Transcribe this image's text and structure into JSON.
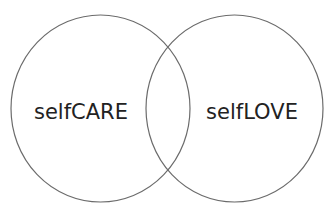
{
  "diagram": {
    "type": "venn",
    "circles": [
      {
        "label": "selfCARE",
        "cx": 100.5,
        "cy": 108.5,
        "rx": 89.5,
        "ry": 93.5
      },
      {
        "label": "selfLOVE",
        "cx": 234.5,
        "cy": 108.5,
        "rx": 88.5,
        "ry": 93.5
      }
    ],
    "stroke_color": "#6b6b6b",
    "text_color": "#222222"
  }
}
